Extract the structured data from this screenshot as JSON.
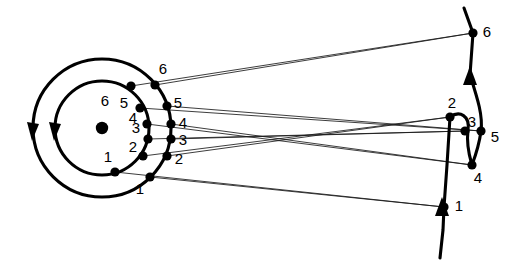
{
  "figure": {
    "title": "",
    "background_color": "#ffffff",
    "stroke_color": "#000000",
    "thin_line_color": "#1a1a1a"
  },
  "left_system": {
    "name": "concentric-circles",
    "center": {
      "x": 102,
      "y": 128
    },
    "center_marker": "filled-dot",
    "outer_circle": {
      "radius": 69,
      "direction_arrow": "down",
      "points": [
        {
          "id": "1",
          "label": "1",
          "x": 150,
          "y": 177,
          "label_x": 140,
          "label_y": 190
        },
        {
          "id": "2",
          "label": "2",
          "x": 167,
          "y": 156,
          "label_x": 179,
          "label_y": 160
        },
        {
          "id": "3",
          "label": "3",
          "x": 171,
          "y": 139,
          "label_x": 183,
          "label_y": 141
        },
        {
          "id": "4",
          "label": "4",
          "x": 171,
          "y": 124,
          "label_x": 183,
          "label_y": 124
        },
        {
          "id": "5",
          "label": "5",
          "x": 167,
          "y": 106,
          "label_x": 178,
          "label_y": 104
        },
        {
          "id": "6",
          "label": "6",
          "x": 155,
          "y": 85,
          "label_x": 163,
          "label_y": 70
        }
      ]
    },
    "inner_circle": {
      "radius": 47,
      "direction_arrow": "down",
      "points": [
        {
          "id": "1",
          "label": "1",
          "x": 115,
          "y": 172,
          "label_x": 108,
          "label_y": 158
        },
        {
          "id": "2",
          "label": "2",
          "x": 143,
          "y": 156,
          "label_x": 133,
          "label_y": 148
        },
        {
          "id": "3",
          "label": "3",
          "x": 148,
          "y": 139,
          "label_x": 136,
          "label_y": 129
        },
        {
          "id": "4",
          "label": "4",
          "x": 147,
          "y": 124,
          "label_x": 133,
          "label_y": 119
        },
        {
          "id": "5",
          "label": "5",
          "x": 140,
          "y": 108,
          "label_x": 124,
          "label_y": 104
        },
        {
          "id": "6",
          "label": "6",
          "x": 131,
          "y": 86,
          "label_x": 105,
          "label_y": 102
        }
      ]
    }
  },
  "right_system": {
    "name": "trajectory-with-loop",
    "direction_arrows": [
      "up",
      "up"
    ],
    "points": [
      {
        "id": "1",
        "label": "1",
        "x": 444,
        "y": 207,
        "label_x": 459,
        "label_y": 207
      },
      {
        "id": "2",
        "label": "2",
        "x": 450,
        "y": 117,
        "label_x": 452,
        "label_y": 104
      },
      {
        "id": "3",
        "label": "3",
        "x": 465,
        "y": 131,
        "label_x": 472,
        "label_y": 123
      },
      {
        "id": "4",
        "label": "4",
        "x": 472,
        "y": 165,
        "label_x": 478,
        "label_y": 179
      },
      {
        "id": "5",
        "label": "5",
        "x": 481,
        "y": 131,
        "label_x": 495,
        "label_y": 138
      },
      {
        "id": "6",
        "label": "6",
        "x": 473,
        "y": 33,
        "label_x": 487,
        "label_y": 33
      }
    ]
  },
  "connections": [
    {
      "from": "outer-1",
      "to": "right-1",
      "x1": 150,
      "y1": 177,
      "x2": 444,
      "y2": 207
    },
    {
      "from": "outer-2",
      "to": "right-2",
      "x1": 167,
      "y1": 156,
      "x2": 450,
      "y2": 117
    },
    {
      "from": "outer-3",
      "to": "right-3",
      "x1": 171,
      "y1": 139,
      "x2": 465,
      "y2": 131
    },
    {
      "from": "outer-4",
      "to": "right-4",
      "x1": 171,
      "y1": 124,
      "x2": 472,
      "y2": 165
    },
    {
      "from": "outer-5",
      "to": "right-5",
      "x1": 167,
      "y1": 106,
      "x2": 481,
      "y2": 131
    },
    {
      "from": "outer-6",
      "to": "right-6",
      "x1": 155,
      "y1": 85,
      "x2": 473,
      "y2": 33
    },
    {
      "from": "inner-1",
      "to": "right-1",
      "x1": 115,
      "y1": 172,
      "x2": 444,
      "y2": 207
    },
    {
      "from": "inner-2",
      "to": "right-2",
      "x1": 143,
      "y1": 156,
      "x2": 450,
      "y2": 117
    },
    {
      "from": "inner-3",
      "to": "right-3",
      "x1": 148,
      "y1": 139,
      "x2": 465,
      "y2": 131
    },
    {
      "from": "inner-4",
      "to": "right-4",
      "x1": 147,
      "y1": 124,
      "x2": 472,
      "y2": 165
    },
    {
      "from": "inner-5",
      "to": "right-5",
      "x1": 140,
      "y1": 108,
      "x2": 481,
      "y2": 131
    },
    {
      "from": "inner-6",
      "to": "right-6",
      "x1": 131,
      "y1": 86,
      "x2": 473,
      "y2": 33
    }
  ]
}
